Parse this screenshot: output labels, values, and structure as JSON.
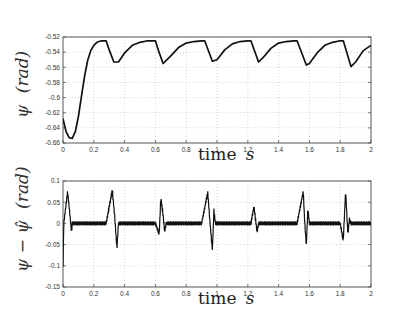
{
  "chart_data": [
    {
      "type": "line",
      "title": "",
      "xlabel": "time s",
      "ylabel": "ψ (rad)",
      "xlim": [
        0,
        2
      ],
      "ylim": [
        -0.66,
        -0.52
      ],
      "grid": true,
      "xticks": [
        "0",
        "0.2",
        "0.4",
        "0.6",
        "0.8",
        "1",
        "1.2",
        "1.4",
        "1.6",
        "1.8",
        "2"
      ],
      "yticks": [
        "-0.52",
        "-0.54",
        "-0.56",
        "-0.58",
        "-0.6",
        "-0.62",
        "-0.64",
        "-0.66"
      ],
      "series": [
        {
          "name": "psi",
          "x": [
            0,
            0.02,
            0.04,
            0.06,
            0.08,
            0.1,
            0.12,
            0.14,
            0.16,
            0.18,
            0.2,
            0.22,
            0.25,
            0.28,
            0.3,
            0.33,
            0.36,
            0.4,
            0.45,
            0.5,
            0.55,
            0.6,
            0.62,
            0.65,
            0.7,
            0.75,
            0.8,
            0.85,
            0.9,
            0.92,
            0.97,
            1.0,
            1.05,
            1.1,
            1.15,
            1.2,
            1.22,
            1.27,
            1.3,
            1.35,
            1.4,
            1.45,
            1.5,
            1.52,
            1.58,
            1.6,
            1.65,
            1.7,
            1.75,
            1.8,
            1.82,
            1.87,
            1.9,
            1.95,
            2.0
          ],
          "y": [
            -0.628,
            -0.645,
            -0.653,
            -0.654,
            -0.645,
            -0.625,
            -0.598,
            -0.572,
            -0.551,
            -0.538,
            -0.531,
            -0.527,
            -0.525,
            -0.525,
            -0.537,
            -0.553,
            -0.553,
            -0.541,
            -0.531,
            -0.527,
            -0.525,
            -0.525,
            -0.538,
            -0.555,
            -0.545,
            -0.534,
            -0.528,
            -0.526,
            -0.525,
            -0.525,
            -0.552,
            -0.55,
            -0.537,
            -0.529,
            -0.526,
            -0.525,
            -0.525,
            -0.553,
            -0.547,
            -0.535,
            -0.528,
            -0.526,
            -0.525,
            -0.525,
            -0.557,
            -0.555,
            -0.541,
            -0.531,
            -0.527,
            -0.525,
            -0.525,
            -0.559,
            -0.553,
            -0.538,
            -0.531
          ]
        }
      ]
    },
    {
      "type": "line",
      "title": "",
      "xlabel": "time s",
      "ylabel": "ψ − ψ̂ (rad)",
      "xlim": [
        0,
        2
      ],
      "ylim": [
        -0.15,
        0.1
      ],
      "grid": true,
      "xticks": [
        "0",
        "0.2",
        "0.4",
        "0.6",
        "0.8",
        "1",
        "1.2",
        "1.4",
        "1.6",
        "1.8",
        "2"
      ],
      "yticks": [
        "0.1",
        "0.05",
        "0",
        "-0.05",
        "-0.1",
        "-0.15"
      ],
      "series": [
        {
          "name": "estimation error",
          "x": [
            0,
            0.005,
            0.03,
            0.045,
            0.055,
            0.06,
            0.07,
            0.28,
            0.32,
            0.335,
            0.35,
            0.36,
            0.37,
            0.6,
            0.625,
            0.635,
            0.65,
            0.66,
            0.67,
            0.9,
            0.94,
            0.955,
            0.97,
            0.98,
            0.99,
            1.22,
            1.24,
            1.25,
            1.26,
            1.27,
            1.52,
            1.56,
            1.57,
            1.58,
            1.59,
            1.6,
            1.8,
            1.82,
            1.835,
            1.85,
            1.86,
            1.87,
            2.0
          ],
          "y": [
            -0.1,
            0.0,
            0.075,
            0.02,
            -0.02,
            0.0,
            0.0,
            0.0,
            0.078,
            0.02,
            -0.06,
            0.0,
            0.0,
            0.0,
            -0.025,
            0.06,
            0.02,
            -0.02,
            0.0,
            0.0,
            0.073,
            0.0,
            -0.063,
            0.03,
            0.0,
            0.0,
            0.04,
            0.01,
            -0.02,
            0.0,
            0.0,
            0.075,
            0.0,
            -0.052,
            0.035,
            0.0,
            0.0,
            -0.04,
            0.076,
            -0.025,
            0.01,
            0.0,
            0.0
          ],
          "noise_amplitude": 0.005
        }
      ]
    }
  ],
  "labels": {
    "top_ylabel_main": "ψ",
    "top_ylabel_unit": "(rad)",
    "bottom_ylabel_main": "ψ − ψ̂",
    "bottom_ylabel_unit": "(rad)",
    "xlabel_word": "time",
    "xlabel_unit": "s"
  }
}
